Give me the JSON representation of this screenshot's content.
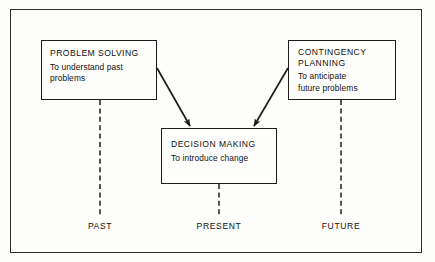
{
  "figure": {
    "frame_color": "#2b2b2b",
    "background": "#fdfdfc",
    "line_color": "#1d1d1d"
  },
  "nodes": [
    {
      "id": "problem-solving",
      "title": "PROBLEM SOLVING",
      "description": "To understand past\nproblems"
    },
    {
      "id": "decision-making",
      "title": "DECISION MAKING",
      "description": "To introduce change"
    },
    {
      "id": "contingency-planning",
      "title": "CONTINGENCY\nPLANNING",
      "description": "To anticipate\nfuture problems"
    }
  ],
  "timeline": {
    "past": "PAST",
    "present": "PRESENT",
    "future": "FUTURE"
  },
  "connectors": [
    {
      "id": "problem-solving-to-decision-making",
      "from": "problem-solving",
      "to": "decision-making",
      "style": "solid-arrow"
    },
    {
      "id": "contingency-planning-to-decision-making",
      "from": "contingency-planning",
      "to": "decision-making",
      "style": "solid-arrow"
    },
    {
      "id": "problem-solving-to-past",
      "from": "problem-solving",
      "to": "past",
      "style": "dashed-stem"
    },
    {
      "id": "decision-making-to-present",
      "from": "decision-making",
      "to": "present",
      "style": "dashed-stem"
    },
    {
      "id": "contingency-planning-to-future",
      "from": "contingency-planning",
      "to": "future",
      "style": "dashed-stem"
    }
  ]
}
